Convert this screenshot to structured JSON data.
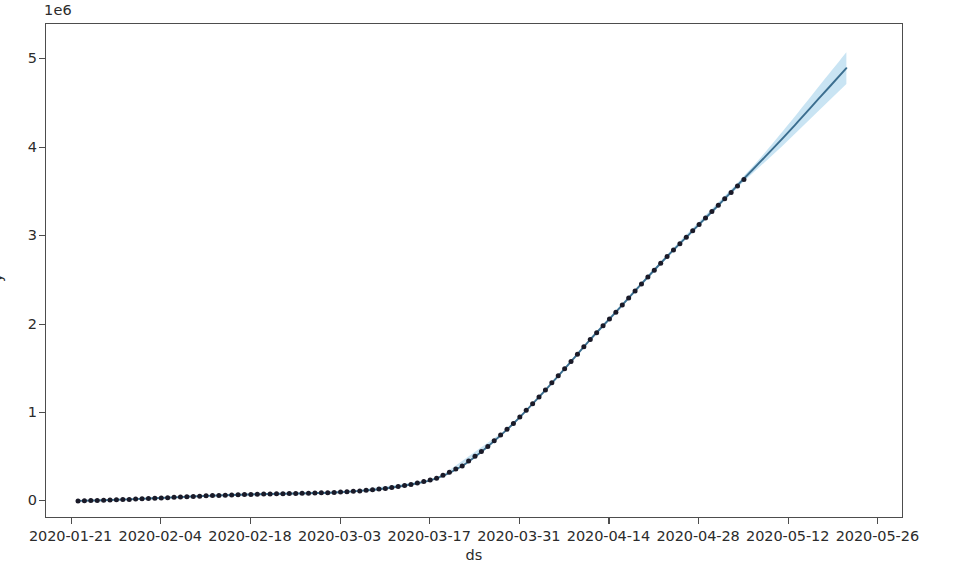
{
  "chart_data": {
    "type": "line",
    "title": "",
    "xlabel": "ds",
    "ylabel": "y",
    "y_offset_label": "1e6",
    "y_offset_multiplier": 1000000,
    "grid": false,
    "legend": false,
    "xlim": [
      "2020-01-17",
      "2020-05-30"
    ],
    "ylim": [
      -200000,
      5400000
    ],
    "ytick_labels": [
      "0",
      "1",
      "2",
      "3",
      "4",
      "5"
    ],
    "ytick_values": [
      0,
      1000000,
      2000000,
      3000000,
      4000000,
      5000000
    ],
    "xtick_labels": [
      "2020-01-21",
      "2020-02-04",
      "2020-02-18",
      "2020-03-03",
      "2020-03-17",
      "2020-03-31",
      "2020-04-14",
      "2020-04-28",
      "2020-05-12",
      "2020-05-26"
    ],
    "colors": {
      "forecast_line": "#3b6e8f",
      "uncertainty_band": "#badcf0",
      "observed_points": "#1a1a28",
      "axis": "#4d4d4d",
      "background": "#ffffff"
    },
    "series": [
      {
        "name": "yhat",
        "type": "line",
        "color": "#3b6e8f",
        "x": [
          "2020-01-22",
          "2020-01-26",
          "2020-01-30",
          "2020-02-03",
          "2020-02-07",
          "2020-02-11",
          "2020-02-15",
          "2020-02-19",
          "2020-02-23",
          "2020-02-27",
          "2020-03-02",
          "2020-03-06",
          "2020-03-10",
          "2020-03-14",
          "2020-03-18",
          "2020-03-22",
          "2020-03-26",
          "2020-03-30",
          "2020-04-03",
          "2020-04-07",
          "2020-04-11",
          "2020-04-15",
          "2020-04-19",
          "2020-04-23",
          "2020-04-27",
          "2020-05-01",
          "2020-05-05",
          "2020-05-09",
          "2020-05-13",
          "2020-05-17",
          "2020-05-21"
        ],
        "values": [
          5000,
          12000,
          22000,
          35000,
          48000,
          62000,
          72000,
          80000,
          86000,
          92000,
          100000,
          118000,
          145000,
          190000,
          260000,
          400000,
          620000,
          880000,
          1180000,
          1500000,
          1830000,
          2140000,
          2460000,
          2770000,
          3060000,
          3350000,
          3650000,
          3950000,
          4260000,
          4580000,
          4900000
        ]
      },
      {
        "name": "observed",
        "type": "scatter",
        "color": "#1a1a28",
        "x": [
          "2020-01-22",
          "2020-01-26",
          "2020-01-30",
          "2020-02-03",
          "2020-02-07",
          "2020-02-11",
          "2020-02-15",
          "2020-02-19",
          "2020-02-23",
          "2020-02-27",
          "2020-03-02",
          "2020-03-06",
          "2020-03-10",
          "2020-03-14",
          "2020-03-18",
          "2020-03-22",
          "2020-03-26",
          "2020-03-30",
          "2020-04-03",
          "2020-04-07",
          "2020-04-11",
          "2020-04-15",
          "2020-04-19",
          "2020-04-23",
          "2020-04-27",
          "2020-05-01",
          "2020-05-05"
        ],
        "values": [
          5000,
          12000,
          22000,
          35000,
          48000,
          62000,
          72000,
          80000,
          86000,
          92000,
          100000,
          118000,
          145000,
          190000,
          260000,
          400000,
          620000,
          880000,
          1180000,
          1500000,
          1830000,
          2140000,
          2460000,
          2770000,
          3060000,
          3350000,
          3640000
        ]
      }
    ],
    "uncertainty": {
      "name": "yhat_lower / yhat_upper",
      "color": "#badcf0",
      "x": [
        "2020-01-22",
        "2020-02-11",
        "2020-03-02",
        "2020-03-18",
        "2020-03-30",
        "2020-04-11",
        "2020-04-23",
        "2020-05-05",
        "2020-05-11",
        "2020-05-17",
        "2020-05-21"
      ],
      "lower": [
        0,
        55000,
        92000,
        250000,
        870000,
        1820000,
        2755000,
        3620000,
        4020000,
        4440000,
        4720000
      ],
      "upper": [
        12000,
        70000,
        110000,
        272000,
        892000,
        1845000,
        2790000,
        3680000,
        4180000,
        4720000,
        5080000
      ]
    },
    "forecast_start": "2020-05-05",
    "observation_count": 27
  },
  "axes": {
    "y_offset_text": "1e6",
    "y_axis_title": "y",
    "x_axis_title": "ds"
  }
}
